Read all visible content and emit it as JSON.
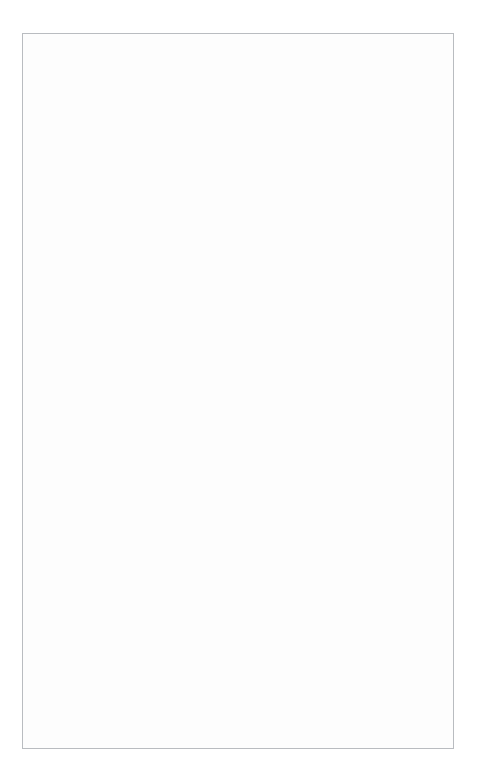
{
  "meta": {
    "digits": [
      "0",
      "1",
      "2",
      "3",
      "4",
      "5",
      "6",
      "7",
      "8",
      "9"
    ]
  },
  "annotations": {
    "write_answer": "Write answer →\nin boxes.",
    "grid_in_result": "Grid in\nresult.",
    "fraction_line": "← Fraction\nline",
    "decimal_point": "← Decimal\npoint"
  },
  "sections": [
    {
      "id": "top",
      "headings": [
        {
          "id": "answer-five-sixteenths",
          "prefix": "Answer:",
          "fraction": {
            "numerator": "5",
            "denominator": "16"
          }
        },
        {
          "id": "answer-three-point-seven",
          "text": "Answer: 3.7"
        }
      ],
      "grids": [
        {
          "id": "grid-5-over-16",
          "written": [
            "5",
            "/",
            "1",
            "6"
          ],
          "slash_row": [
            null,
            "fill",
            "slash",
            "slash"
          ],
          "decimal_row": [
            "open",
            "open",
            "open",
            "open"
          ],
          "zero_row": [
            null,
            "0",
            "0",
            "0"
          ],
          "marked": [
            5,
            1,
            6,
            null
          ],
          "marked_map": {
            "col0": "5",
            "col1": "1",
            "col2": "6",
            "col3": null
          }
        },
        {
          "id": "grid-3-point-7",
          "written": [
            "",
            "3",
            ".",
            "7"
          ],
          "slash_row": [
            null,
            "slash",
            "slash",
            "slash"
          ],
          "decimal_row": [
            "open",
            "open",
            "fill",
            "open"
          ],
          "zero_row": [
            null,
            "0",
            "0",
            "0"
          ],
          "marked_map": {
            "col0": null,
            "col1": "3",
            "col2": null,
            "col3": "7"
          }
        }
      ]
    },
    {
      "id": "middle",
      "heading": {
        "id": "acceptable-ways",
        "prefix": "Acceptable ways to grid",
        "fraction": {
          "numerator": "1",
          "denominator": "3"
        },
        "suffix": "are:"
      },
      "grids": [
        {
          "id": "grid-1-slash-3",
          "written": [
            "",
            "1",
            "/",
            "3"
          ],
          "slash_row": [
            null,
            "slash",
            "fill",
            "slash"
          ],
          "decimal_row": [
            "open",
            "open",
            "open",
            "open"
          ],
          "zero_row": [
            null,
            "0",
            "0",
            "0"
          ],
          "marked_map": {
            "col0": null,
            "col1": "1",
            "col2": null,
            "col3": "3"
          }
        },
        {
          "id": "grid-point-333",
          "written": [
            ".",
            "3",
            "3",
            "3"
          ],
          "slash_row": [
            null,
            "slash",
            "slash",
            "slash"
          ],
          "decimal_row": [
            "fill",
            "open",
            "open",
            "open"
          ],
          "zero_row": [
            null,
            "0",
            "0",
            "0"
          ],
          "marked_map": {
            "col0": null,
            "col1": "3",
            "col2": "3",
            "col3": "3"
          }
        },
        {
          "id": "grid-point-334",
          "written": [
            ".",
            "3",
            "3",
            "4"
          ],
          "slash_row": [
            null,
            "slash",
            "slash",
            "slash"
          ],
          "decimal_row": [
            "fill",
            "open",
            "open",
            "open"
          ],
          "zero_row": [
            null,
            "0",
            "0",
            "0"
          ],
          "marked_map": {
            "col0": null,
            "col1": "3",
            "col2": "3",
            "col3": "4"
          }
        }
      ]
    },
    {
      "id": "bottom",
      "heading": {
        "id": "answer-184",
        "text": "Answer: 184—either position is correct"
      },
      "grids": [
        {
          "id": "grid-184-right",
          "written": [
            "",
            "1",
            "8",
            "4"
          ],
          "slash_row": [
            null,
            "slash",
            "slash",
            "slash"
          ],
          "decimal_row": [
            "open",
            "open",
            "open",
            "open"
          ],
          "zero_row": [
            null,
            "0",
            "0",
            "0"
          ],
          "marked_map": {
            "col0": null,
            "col1": "1",
            "col2": "8",
            "col3": "4"
          }
        },
        {
          "id": "grid-184-left",
          "written": [
            "1",
            "8",
            "4",
            ""
          ],
          "slash_row": [
            null,
            "slash",
            "slash",
            "slash"
          ],
          "decimal_row": [
            "open",
            "open",
            "open",
            "open"
          ],
          "zero_row": [
            null,
            "0",
            "0",
            "0"
          ],
          "marked_map": {
            "col0": "1",
            "col1": "8",
            "col2": "4",
            "col3": null
          }
        }
      ],
      "note": {
        "label": "NOTE:",
        "text": " You may start your answers in any column, space permitting. Columns you don't need to use should be left blank."
      }
    }
  ]
}
